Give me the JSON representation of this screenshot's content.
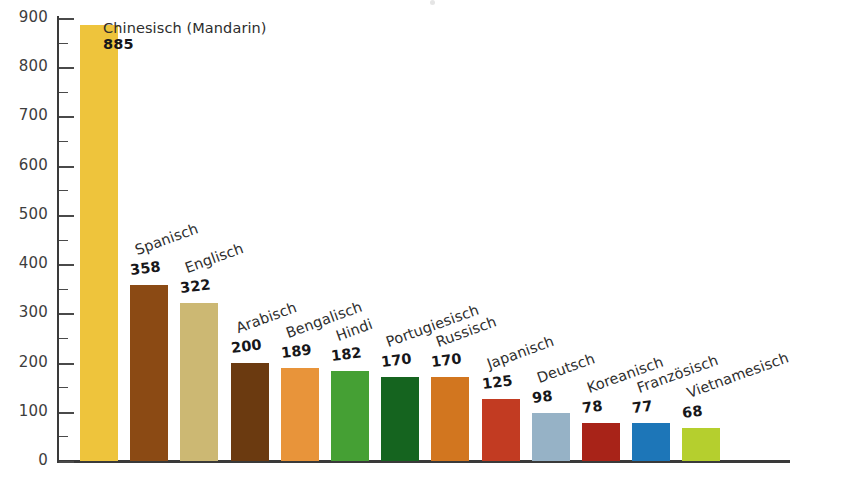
{
  "chart_data": {
    "type": "bar",
    "title": "",
    "subtitle": "",
    "xlabel": "",
    "ylabel": "",
    "ylim": [
      0,
      900
    ],
    "grid": false,
    "legend": false,
    "y_ticks_major": [
      0,
      100,
      200,
      300,
      400,
      500,
      600,
      700,
      800,
      900
    ],
    "y_ticks_minor": [
      50,
      150,
      250,
      350,
      450,
      550,
      650,
      750,
      850
    ],
    "y_tick_labels": [
      "0",
      "100",
      "200",
      "300",
      "400",
      "500",
      "600",
      "700",
      "800",
      "900"
    ],
    "categories": [
      "Chinesisch (Mandarin)",
      "Spanisch",
      "Englisch",
      "Arabisch",
      "Bengalisch",
      "Hindi",
      "Portugiesisch",
      "Russisch",
      "Japanisch",
      "Deutsch",
      "Koreanisch",
      "Französisch",
      "Vietnamesisch"
    ],
    "values": [
      885,
      358,
      322,
      200,
      189,
      182,
      170,
      170,
      125,
      98,
      78,
      77,
      68
    ],
    "value_labels": [
      "885",
      "358",
      "322",
      "200",
      "189",
      "182",
      "170",
      "170",
      "125",
      "98",
      "78",
      "77",
      "68"
    ],
    "colors": [
      "#eec43c",
      "#8b4a14",
      "#ccb873",
      "#6b3a10",
      "#e8943a",
      "#45a034",
      "#15641f",
      "#d2761f",
      "#c23b22",
      "#96b2c6",
      "#a82318",
      "#1d76b8",
      "#b5cf2e"
    ],
    "bars": [
      {
        "label": "Chinesisch (Mandarin)",
        "value": 885,
        "value_label": "885",
        "color": "#eec43c",
        "rotated": false
      },
      {
        "label": "Spanisch",
        "value": 358,
        "value_label": "358",
        "color": "#8b4a14",
        "rotated": true
      },
      {
        "label": "Englisch",
        "value": 322,
        "value_label": "322",
        "color": "#ccb873",
        "rotated": true
      },
      {
        "label": "Arabisch",
        "value": 200,
        "value_label": "200",
        "color": "#6b3a10",
        "rotated": true
      },
      {
        "label": "Bengalisch",
        "value": 189,
        "value_label": "189",
        "color": "#e8943a",
        "rotated": true
      },
      {
        "label": "Hindi",
        "value": 182,
        "value_label": "182",
        "color": "#45a034",
        "rotated": true
      },
      {
        "label": "Portugiesisch",
        "value": 170,
        "value_label": "170",
        "color": "#15641f",
        "rotated": true
      },
      {
        "label": "Russisch",
        "value": 170,
        "value_label": "170",
        "color": "#d2761f",
        "rotated": true
      },
      {
        "label": "Japanisch",
        "value": 125,
        "value_label": "125",
        "color": "#c23b22",
        "rotated": true
      },
      {
        "label": "Deutsch",
        "value": 98,
        "value_label": "98",
        "color": "#96b2c6",
        "rotated": true
      },
      {
        "label": "Koreanisch",
        "value": 78,
        "value_label": "78",
        "color": "#a82318",
        "rotated": true
      },
      {
        "label": "Französisch",
        "value": 77,
        "value_label": "77",
        "color": "#1d76b8",
        "rotated": true
      },
      {
        "label": "Vietnamesisch",
        "value": 68,
        "value_label": "68",
        "color": "#b5cf2e",
        "rotated": true
      }
    ],
    "axis_color": "#3a3a3a",
    "text_color": "#2d2d2d",
    "background": "#ffffff"
  }
}
